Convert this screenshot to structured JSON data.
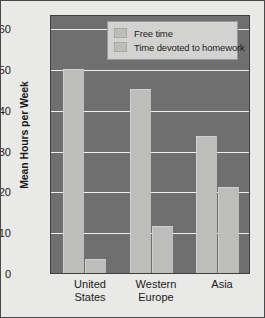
{
  "chart_data": {
    "type": "bar",
    "title": "",
    "subtitle": "",
    "xlabel": "",
    "ylabel": "Mean Hours per Week",
    "categories": [
      "United States",
      "Western Europe",
      "Asia"
    ],
    "series": [
      {
        "name": "Free time",
        "values": [
          50,
          45,
          33.5
        ]
      },
      {
        "name": "Time devoted to homework",
        "values": [
          3.5,
          11.5,
          21
        ]
      }
    ],
    "ylim": [
      0,
      63.5
    ],
    "yticks": [
      0,
      10,
      20,
      30,
      40,
      50,
      60
    ],
    "ytick_labels": [
      "0",
      "10",
      "20",
      "30",
      "40",
      "50",
      "60"
    ],
    "grid": true,
    "legend_position": "top-center-right",
    "colors": {
      "plot_background": "#6f6f6f",
      "page_background": "#e9e9e7",
      "bar_fill": "#bdbdbb",
      "gridline": "#efefef",
      "legend_background": "#d2d2d0",
      "text": "#1a1a1a",
      "frame_border": "#3f3f3f"
    }
  },
  "legend": {
    "items": [
      {
        "label": "Free time"
      },
      {
        "label": "Time devoted to homework"
      }
    ]
  },
  "axis": {
    "y_title": "Mean Hours per Week",
    "y_tick_0": "0",
    "y_tick_1": "10",
    "y_tick_2": "20",
    "y_tick_3": "30",
    "y_tick_4": "40",
    "y_tick_5": "50",
    "y_tick_6": "60"
  },
  "categories": {
    "c0": "United\nStates",
    "c1": "Western\nEurope",
    "c2": "Asia"
  }
}
